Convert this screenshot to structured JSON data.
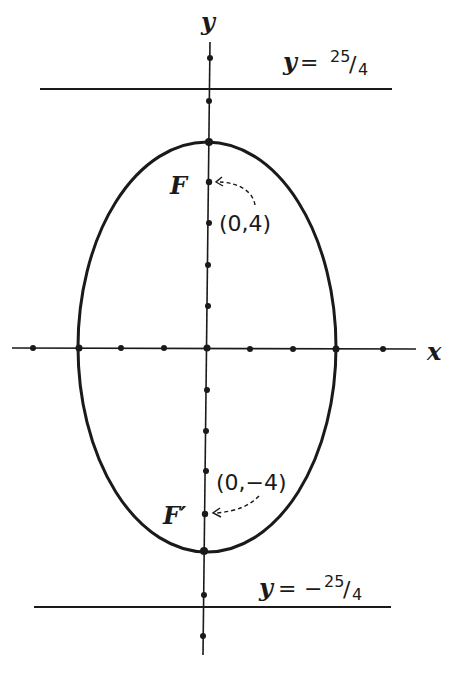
{
  "diagram": {
    "type": "ellipse",
    "equation_implied": "x^2/9 + y^2/25 = 1",
    "semi_major_axis": 5,
    "semi_minor_axis": 3,
    "axes": {
      "x_label": "x",
      "y_label": "y",
      "x_ticks": [
        -4,
        -3,
        -2,
        -1,
        0,
        1,
        2,
        3,
        4
      ],
      "y_ticks": [
        7,
        6,
        5,
        4,
        3,
        2,
        1,
        0,
        -1,
        -2,
        -3,
        -4,
        -5,
        -6,
        -7
      ]
    },
    "foci": [
      {
        "name": "F",
        "label": "F",
        "coord_label": "(0,4)",
        "x": 0,
        "y": 4
      },
      {
        "name": "F-prime",
        "label": "F′",
        "coord_label": "(0,−4)",
        "x": 0,
        "y": -4
      }
    ],
    "directrices": [
      {
        "label_prefix": "y =",
        "sign": "",
        "numerator": "25",
        "denominator": "4",
        "value": 6.25
      },
      {
        "label_prefix": "y =",
        "sign": "−",
        "numerator": "25",
        "denominator": "4",
        "value": -6.25
      }
    ]
  }
}
